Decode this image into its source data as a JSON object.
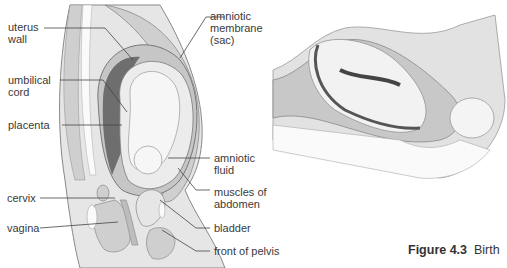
{
  "figure": {
    "number": "Figure 4.3",
    "title": "Birth"
  },
  "left_diagram": {
    "labels": [
      {
        "id": "uterus-wall",
        "text": "uterus\nwall"
      },
      {
        "id": "umbilical-cord",
        "text": "umbilical\ncord"
      },
      {
        "id": "placenta",
        "text": "placenta"
      },
      {
        "id": "cervix",
        "text": "cervix"
      },
      {
        "id": "vagina",
        "text": "vagina"
      },
      {
        "id": "amniotic-membrane",
        "text": "amniotic\nmembrane\n(sac)"
      },
      {
        "id": "amniotic-fluid",
        "text": "amniotic\nfluid"
      },
      {
        "id": "muscles-of-abdomen",
        "text": "muscles of\nabdomen"
      },
      {
        "id": "bladder",
        "text": "bladder"
      },
      {
        "id": "front-of-pelvis",
        "text": "front of pelvis"
      }
    ]
  },
  "colors": {
    "body_fill": "#d9d9d9",
    "uterus_fill": "#c4c4c4",
    "placenta_fill": "#6e6e6e",
    "fluid_fill": "#ececec",
    "baby_fill": "#f4f4f4",
    "outline": "#777777",
    "leader": "#444444"
  }
}
